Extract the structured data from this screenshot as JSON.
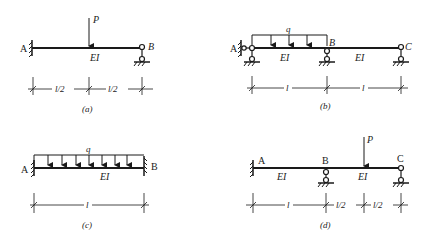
{
  "colors": {
    "ink": "#1a1a1a",
    "background": "#ffffff"
  },
  "panels": [
    {
      "id": "a",
      "caption": "(a)",
      "nodes": [
        "A",
        "B"
      ],
      "supports": {
        "A": "fixed",
        "B": "pin"
      },
      "beam_label": "EI",
      "loads": [
        {
          "type": "point",
          "label": "P",
          "position": "midspan"
        }
      ],
      "dimensions": [
        "l/2",
        "l/2"
      ]
    },
    {
      "id": "b",
      "caption": "(b)",
      "nodes": [
        "A",
        "B",
        "C"
      ],
      "supports": {
        "A": "hinge-to-wall + pin",
        "B": "pin",
        "C": "pin"
      },
      "beam_labels": [
        "EI",
        "EI"
      ],
      "loads": [
        {
          "type": "distributed",
          "label": "q",
          "span": "A-B"
        }
      ],
      "dimensions": [
        "l",
        "l"
      ]
    },
    {
      "id": "c",
      "caption": "(c)",
      "nodes": [
        "A",
        "B"
      ],
      "supports": {
        "A": "fixed",
        "B": "fixed"
      },
      "beam_label": "EI",
      "loads": [
        {
          "type": "distributed",
          "label": "q",
          "span": "A-B"
        }
      ],
      "dimensions": [
        "l"
      ]
    },
    {
      "id": "d",
      "caption": "(d)",
      "nodes": [
        "A",
        "B",
        "C"
      ],
      "supports": {
        "A": "fixed",
        "B": "pin",
        "C": "pin"
      },
      "beam_labels": [
        "EI",
        "EI"
      ],
      "loads": [
        {
          "type": "point",
          "label": "P",
          "position": "midspan B-C"
        }
      ],
      "dimensions": [
        "l",
        "l/2",
        "l/2"
      ]
    }
  ]
}
